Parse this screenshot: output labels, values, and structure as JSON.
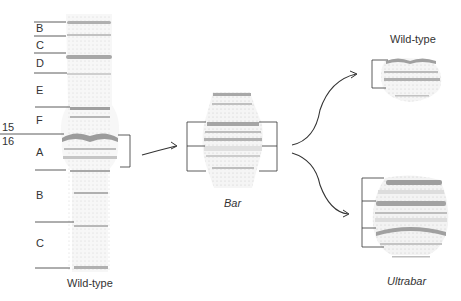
{
  "figure": {
    "left_chromosome": {
      "caption": "Wild-type",
      "region_labels": [
        {
          "label": "B",
          "y": 29
        },
        {
          "label": "C",
          "y": 46
        },
        {
          "label": "D",
          "y": 63
        },
        {
          "label": "E",
          "y": 90
        },
        {
          "label": "F",
          "y": 120
        },
        {
          "label": "A",
          "y": 153
        },
        {
          "label": "B",
          "y": 196
        },
        {
          "label": "C",
          "y": 244
        }
      ],
      "section_numbers": [
        {
          "label": "15",
          "y": 127
        },
        {
          "label": "16",
          "y": 139
        }
      ]
    },
    "middle_chromosome": {
      "caption": "Bar"
    },
    "right_top_chromosome": {
      "caption": "Wild-type"
    },
    "right_bottom_chromosome": {
      "caption": "Ultrabar"
    },
    "colors": {
      "line": "#333333",
      "band_dark": "#9a9a9a",
      "band_light": "#cfcfcf",
      "chromosome_fill": "#f2f2f2"
    }
  }
}
